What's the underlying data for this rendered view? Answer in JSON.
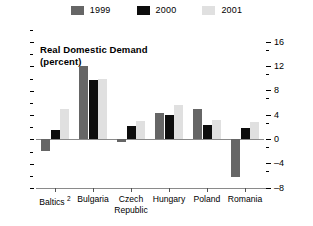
{
  "chart_data": {
    "type": "bar",
    "title": "Real Domestic Demand\n(percent)",
    "xlabel": "",
    "ylabel": "",
    "ylim": [
      -8,
      16
    ],
    "yticks": [
      16,
      12,
      8,
      4,
      0,
      -4,
      -8
    ],
    "ytick_labels": [
      "16",
      "12",
      "8",
      "4",
      "0",
      "–4",
      "–8"
    ],
    "minor_ticks": [
      14,
      10,
      6,
      2,
      -2,
      -6
    ],
    "grid": false,
    "legend_position": "top-center",
    "categories": [
      "Baltics",
      "Bulgaria",
      "Czech Republic",
      "Hungary",
      "Poland",
      "Romania"
    ],
    "category_footnotes": {
      "Baltics": "2"
    },
    "series": [
      {
        "name": "1999",
        "color": "#666666",
        "values": [
          -2.0,
          12.0,
          -0.4,
          4.3,
          5.0,
          -6.2
        ]
      },
      {
        "name": "2000",
        "color": "#0d0d0d",
        "values": [
          1.5,
          9.8,
          2.2,
          4.0,
          2.4,
          1.8
        ]
      },
      {
        "name": "2001",
        "color": "#e0e0e0",
        "values": [
          5.0,
          9.9,
          3.0,
          5.6,
          3.2,
          2.8
        ]
      }
    ]
  },
  "legend": {
    "items": [
      {
        "label": "1999",
        "color": "#666666"
      },
      {
        "label": "2000",
        "color": "#0d0d0d"
      },
      {
        "label": "2001",
        "color": "#e0e0e0"
      }
    ]
  },
  "axis": {
    "y_labels": [
      "16",
      "12",
      "8",
      "4",
      "0",
      "–4",
      "–8"
    ]
  },
  "categories": [
    {
      "label": "Baltics",
      "footnote": "2"
    },
    {
      "label": "Bulgaria",
      "footnote": ""
    },
    {
      "label": "Czech\nRepublic",
      "footnote": ""
    },
    {
      "label": "Hungary",
      "footnote": ""
    },
    {
      "label": "Poland",
      "footnote": ""
    },
    {
      "label": "Romania",
      "footnote": ""
    }
  ]
}
